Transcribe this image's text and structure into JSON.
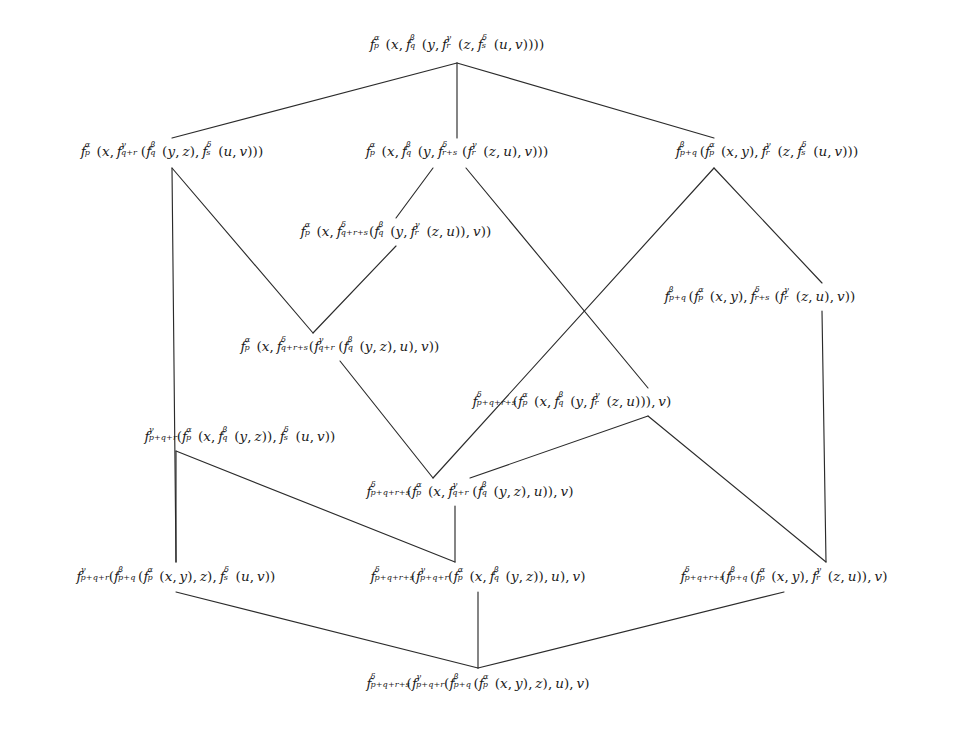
{
  "document": {
    "kind": "mathematical-lattice-diagram",
    "description": "Hasse diagram of rebracketings of a 5-fold composition",
    "background_color": "#ffffff",
    "text_color": "#1a1a1a",
    "edge_color": "#2b2b2b"
  },
  "nodes": [
    {
      "id": "top",
      "label": "f_p^α(x, f_q^β(y, f_r^γ(z, f_s^δ(u,v))))",
      "text": "fp^α(x, fq^β(y, fr^γ(z, fs^δ(u, v))))",
      "x": 457,
      "y": 45,
      "level": 0
    },
    {
      "id": "r1a",
      "label": "f_p^α(x, f_{q+r}^γ(f_q^β(y,z), f_s^δ(u,v)))",
      "text": "fp^α(x, fq+r^γ(fq^β(y, z), fs^δ(u, v)))",
      "x": 172,
      "y": 152,
      "level": 1
    },
    {
      "id": "r1b",
      "label": "f_p^α(x, f_q^β(y, f_{r+s}^δ(f_r^γ(z,u), v)))",
      "text": "fp^α(x, fq^β(y, fr+s^δ(fr^γ(z, u), v)))",
      "x": 457,
      "y": 152,
      "level": 1
    },
    {
      "id": "r1c",
      "label": "f_{p+q}^β(f_p^α(x,y), f_r^γ(z, f_s^δ(u,v)))",
      "text": "fp+q^β(fp^α(x, y), fr^γ(z, fs^δ(u, v)))",
      "x": 767,
      "y": 152,
      "level": 1
    },
    {
      "id": "r2a",
      "label": "f_p^α(x, f_{q+r+s}^δ(f_q^β(y, f_r^γ(z,u)), v))",
      "text": "fp^α(x, fq+r+s^δ(fq^β(y, fr^γ(z, u)), v))",
      "x": 396,
      "y": 232,
      "level": 2
    },
    {
      "id": "r2b",
      "label": "f_{p+q}^β(f_p^α(x,y), f_{r+s}^δ(f_r^γ(z,u), v))",
      "text": "fp+q^β(fp^α(x, y), fr+s^δ(fr^γ(z, u), v))",
      "x": 760,
      "y": 297,
      "level": 2
    },
    {
      "id": "r3a",
      "label": "f_p^α(x, f_{q+r+s}^δ(f_{q+r}^γ(f_q^β(y,z), u), v))",
      "text": "fp^α(x, fq+r+s^δ(fq+r^γ(fq^β(y, z), u), v))",
      "x": 340,
      "y": 347,
      "level": 3
    },
    {
      "id": "r3b",
      "label": "f_{p+q+r+s}^δ(f_p^α(x, f_q^β(y, f_r^γ(z,u))), v)",
      "text": "fp+q+r+s^δ(fp^α(x, fq^β(y, fr^γ(z, u))), v)",
      "x": 572,
      "y": 402,
      "level": 3
    },
    {
      "id": "r4a",
      "label": "f_{p+q+r}^γ(f_p^α(x, f_q^β(y,z)), f_s^δ(u,v))",
      "text": "fp+q+r^γ(fp^α(x, fq^β(y, z)), fs^δ(u, v))",
      "x": 240,
      "y": 437,
      "level": 4
    },
    {
      "id": "r4b",
      "label": "f_{p+q+r+s}^δ(f_p^α(x, f_{q+r}^γ(f_q^β(y,z), u)), v)",
      "text": "fp+q+r+s^δ(fp^α(x, fq+r^γ(fq^β(y, z), u)), v)",
      "x": 470,
      "y": 492,
      "level": 4
    },
    {
      "id": "b1",
      "label": "f_{p+q+r}^γ(f_{p+q}^β(f_p^α(x,y), z), f_s^δ(u,v))",
      "text": "fp+q+r^γ(fp+q^β(fp^α(x, y), z), fs^δ(u, v))",
      "x": 176,
      "y": 577,
      "level": 5
    },
    {
      "id": "b2",
      "label": "f_{p+q+r+s}^δ(f_{p+q+r}^γ(f_p^α(x, f_q^β(y,z)), u), v)",
      "text": "fp+q+r+s^δ(fp+q+r^γ(fp^α(x, fq^β(y, z)), u), v)",
      "x": 478,
      "y": 577,
      "level": 5
    },
    {
      "id": "b3",
      "label": "f_{p+q+r+s}^δ(f_{p+q}^β(f_p^α(x,y), f_r^γ(z,u)), v)",
      "text": "fp+q+r+s^δ(fp+q^β(fp^α(x, y), fr^γ(z, u)), v)",
      "x": 784,
      "y": 577,
      "level": 5
    },
    {
      "id": "bottom",
      "label": "f_{p+q+r+s}^δ(f_{p+q+r}^γ(f_{p+q}^β(f_p^α(x,y), z), u), v)",
      "text": "fp+q+r+s^δ(fp+q+r^γ(fp+q^β(fp^α(x, y), z), u), v)",
      "x": 478,
      "y": 684,
      "level": 6
    }
  ],
  "edges": [
    {
      "from": "top",
      "to": "r1a",
      "x1": 457,
      "y1": 63,
      "x2": 172,
      "y2": 138
    },
    {
      "from": "top",
      "to": "r1b",
      "x1": 457,
      "y1": 63,
      "x2": 457,
      "y2": 138
    },
    {
      "from": "top",
      "to": "r1c",
      "x1": 457,
      "y1": 63,
      "x2": 714,
      "y2": 138
    },
    {
      "from": "r1a",
      "to": "b1",
      "x1": 172,
      "y1": 168,
      "x2": 176,
      "y2": 562
    },
    {
      "from": "r1a",
      "to": "r3a",
      "x1": 172,
      "y1": 168,
      "x2": 313,
      "y2": 333
    },
    {
      "from": "r1b",
      "to": "r2a",
      "x1": 433,
      "y1": 168,
      "x2": 396,
      "y2": 218
    },
    {
      "from": "r1b",
      "to": "r3b",
      "x1": 466,
      "y1": 168,
      "x2": 648,
      "y2": 388
    },
    {
      "from": "r1c",
      "to": "r2b",
      "x1": 714,
      "y1": 168,
      "x2": 822,
      "y2": 283
    },
    {
      "from": "r1c",
      "to": "r4b",
      "x1": 714,
      "y1": 168,
      "x2": 433,
      "y2": 478
    },
    {
      "from": "r2a",
      "to": "r3a",
      "x1": 396,
      "y1": 246,
      "x2": 313,
      "y2": 333
    },
    {
      "from": "r2b",
      "to": "b3",
      "x1": 822,
      "y1": 311,
      "x2": 826,
      "y2": 562
    },
    {
      "from": "r3a",
      "to": "r4b",
      "x1": 340,
      "y1": 361,
      "x2": 433,
      "y2": 478
    },
    {
      "from": "r3b",
      "to": "r4b",
      "x1": 648,
      "y1": 416,
      "x2": 470,
      "y2": 478
    },
    {
      "from": "r3b",
      "to": "b3",
      "x1": 648,
      "y1": 416,
      "x2": 826,
      "y2": 562
    },
    {
      "from": "r4a",
      "to": "b1",
      "x1": 176,
      "y1": 451,
      "x2": 176,
      "y2": 562
    },
    {
      "from": "r4a",
      "to": "b2",
      "x1": 176,
      "y1": 451,
      "x2": 455,
      "y2": 562
    },
    {
      "from": "r4b",
      "to": "b2",
      "x1": 455,
      "y1": 506,
      "x2": 455,
      "y2": 562
    },
    {
      "from": "b1",
      "to": "bottom",
      "x1": 176,
      "y1": 592,
      "x2": 478,
      "y2": 668
    },
    {
      "from": "b2",
      "to": "bottom",
      "x1": 478,
      "y1": 592,
      "x2": 478,
      "y2": 668
    },
    {
      "from": "b3",
      "to": "bottom",
      "x1": 784,
      "y1": 592,
      "x2": 478,
      "y2": 668
    }
  ],
  "symbols": {
    "alpha": "α",
    "beta": "β",
    "gamma": "γ",
    "delta": "δ",
    "f": "f",
    "x": "x",
    "y": "y",
    "z": "z",
    "u": "u",
    "v": "v",
    "p": "p",
    "q": "q",
    "r": "r",
    "s": "s"
  }
}
